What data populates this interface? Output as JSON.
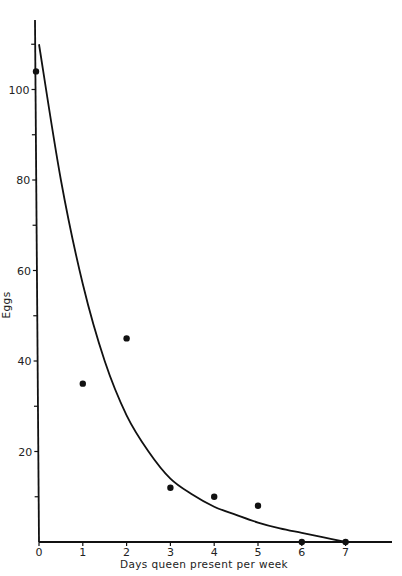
{
  "chart_data": {
    "type": "scatter",
    "title": "",
    "xlabel": "Days queen present per week",
    "ylabel": "Eggs",
    "x_ticks": [
      0,
      1,
      2,
      3,
      4,
      5,
      6,
      7
    ],
    "x_tick_labels": [
      "0",
      "1",
      "2",
      "3",
      "4",
      "5",
      "6",
      "7"
    ],
    "y_major_ticks": [
      20,
      40,
      60,
      80,
      100
    ],
    "y_tick_labels": [
      "20",
      "40",
      "60",
      "80",
      "100"
    ],
    "y_minor_ticks": [
      10,
      30,
      50,
      70,
      90,
      110
    ],
    "xlim": [
      0,
      8
    ],
    "ylim": [
      0,
      115
    ],
    "grid": false,
    "legend": null,
    "series": [
      {
        "name": "Observed eggs",
        "kind": "points",
        "x": [
          0,
          1,
          2,
          3,
          4,
          5,
          6,
          7
        ],
        "y": [
          104,
          35,
          45,
          12,
          10,
          8,
          0,
          0
        ]
      },
      {
        "name": "Fitted curve",
        "kind": "line",
        "x": [
          0,
          0.5,
          1,
          1.5,
          2,
          2.5,
          3,
          3.5,
          4,
          4.5,
          5,
          5.5,
          6,
          6.5,
          7
        ],
        "y": [
          110,
          80,
          57,
          40,
          28,
          20,
          14,
          10.5,
          7.8,
          6,
          4.3,
          3,
          2,
          1,
          0
        ]
      }
    ]
  }
}
